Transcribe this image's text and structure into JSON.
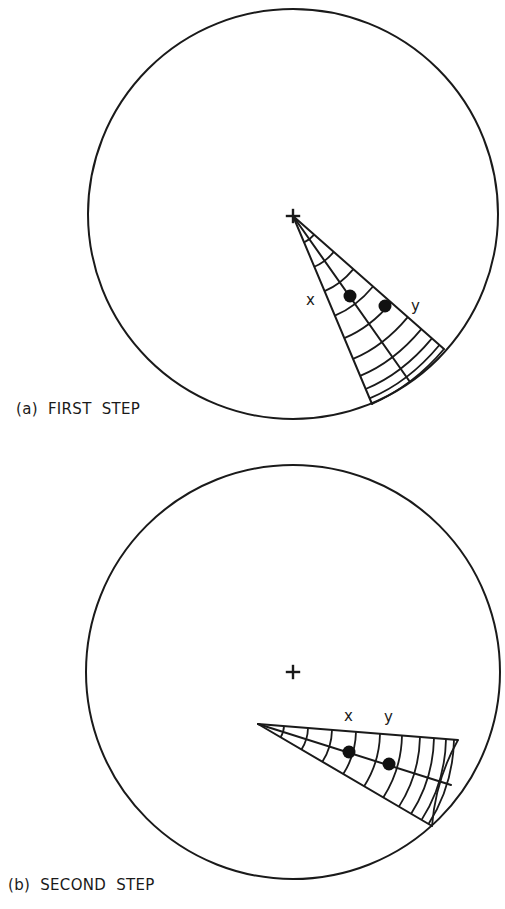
{
  "figure": {
    "panels": [
      {
        "id": "a",
        "caption": "(a)  FIRST  STEP",
        "circle": {
          "cx": 293,
          "cy": 214,
          "r": 205
        },
        "cross": {
          "x": 293,
          "y": 216
        },
        "wedge": {
          "apex": [
            293,
            216
          ],
          "ends": [
            [
              372,
              404
            ],
            [
              410,
              382
            ],
            [
              444,
              349
            ]
          ],
          "arc_fractions": [
            0.14,
            0.27,
            0.4,
            0.53,
            0.65,
            0.76,
            0.85,
            0.92,
            0.97
          ]
        },
        "points": [
          {
            "label": "x",
            "dot": [
              350,
              296
            ],
            "label_pos": [
              306,
              305
            ]
          },
          {
            "label": "y",
            "dot": [
              385,
              306
            ],
            "label_pos": [
              411,
              311
            ]
          }
        ]
      },
      {
        "id": "b",
        "caption": "(b)  SECOND  STEP",
        "circle": {
          "cx": 293,
          "cy": 672,
          "r": 207
        },
        "cross": {
          "x": 293,
          "y": 672
        },
        "wedge": {
          "apex": [
            258,
            724
          ],
          "ends": [
            [
              458,
              740
            ],
            [
              451,
              785
            ],
            [
              432,
              826
            ]
          ],
          "arc_fractions": [
            0.13,
            0.25,
            0.37,
            0.49,
            0.61,
            0.72,
            0.81,
            0.88,
            0.94,
            0.98
          ]
        },
        "points": [
          {
            "label": "x",
            "dot": [
              349,
              752
            ],
            "label_pos": [
              344,
              721
            ]
          },
          {
            "label": "y",
            "dot": [
              389,
              764
            ],
            "label_pos": [
              384,
              722
            ]
          }
        ]
      }
    ],
    "colors": {
      "ink": "#1a1a1a",
      "background": "#ffffff"
    }
  }
}
